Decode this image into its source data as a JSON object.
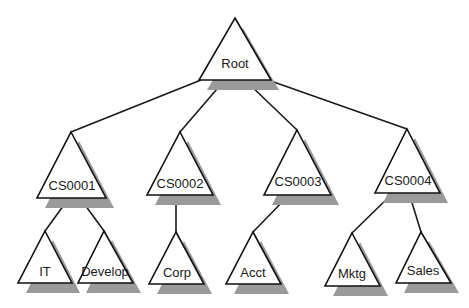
{
  "diagram": {
    "type": "tree",
    "colors": {
      "stroke": "#111111",
      "fill": "#ffffff",
      "shadow": "#9a9a9a",
      "text": "#1a1a1a"
    },
    "nodes": [
      {
        "id": "root",
        "label": "Root",
        "shape": "triangle",
        "level": 0
      },
      {
        "id": "cs0001",
        "label": "CS0001",
        "shape": "triangle",
        "level": 1,
        "parent": "root"
      },
      {
        "id": "cs0002",
        "label": "CS0002",
        "shape": "triangle",
        "level": 1,
        "parent": "root"
      },
      {
        "id": "cs0003",
        "label": "CS0003",
        "shape": "triangle",
        "level": 1,
        "parent": "root"
      },
      {
        "id": "cs0004",
        "label": "CS0004",
        "shape": "triangle",
        "level": 1,
        "parent": "root"
      },
      {
        "id": "it",
        "label": "IT",
        "shape": "triangle",
        "level": 2,
        "parent": "cs0001"
      },
      {
        "id": "develop",
        "label": "Develop",
        "shape": "triangle",
        "level": 2,
        "parent": "cs0001"
      },
      {
        "id": "corp",
        "label": "Corp",
        "shape": "triangle",
        "level": 2,
        "parent": "cs0002"
      },
      {
        "id": "acct",
        "label": "Acct",
        "shape": "triangle",
        "level": 2,
        "parent": "cs0003"
      },
      {
        "id": "mktg",
        "label": "Mktg",
        "shape": "triangle",
        "level": 2,
        "parent": "cs0004"
      },
      {
        "id": "sales",
        "label": "Sales",
        "shape": "triangle",
        "level": 2,
        "parent": "cs0004"
      }
    ],
    "edges": [
      {
        "from": "root",
        "to": "cs0001"
      },
      {
        "from": "root",
        "to": "cs0002"
      },
      {
        "from": "root",
        "to": "cs0003"
      },
      {
        "from": "root",
        "to": "cs0004"
      },
      {
        "from": "cs0001",
        "to": "it"
      },
      {
        "from": "cs0001",
        "to": "develop"
      },
      {
        "from": "cs0002",
        "to": "corp"
      },
      {
        "from": "cs0003",
        "to": "acct"
      },
      {
        "from": "cs0004",
        "to": "mktg"
      },
      {
        "from": "cs0004",
        "to": "sales"
      }
    ]
  }
}
